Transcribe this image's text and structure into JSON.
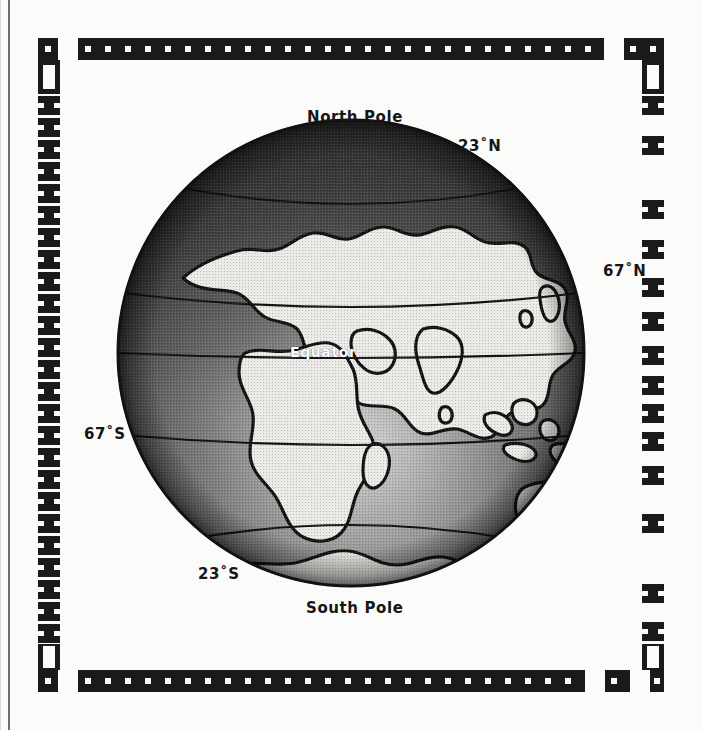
{
  "figure": {
    "type": "globe-illustration",
    "projection": "orthographic",
    "centered_on": "Africa / Indian Ocean",
    "background_color": "#fbfbf9",
    "ink_color": "#161616",
    "ocean_color": "#575757",
    "land_color": "#ededeb",
    "highlight_color": "#e8e8e6"
  },
  "labels": {
    "north_pole": "North Pole",
    "south_pole": "South Pole",
    "tropic_north": "23˚N",
    "circle_north": "67˚N",
    "circle_south": "67˚S",
    "tropic_south": "23˚S",
    "equator": "Equator"
  },
  "latitude_lines": [
    {
      "name": "tropic-of-cancer",
      "label": "23˚N",
      "latitude": 23,
      "side": "right"
    },
    {
      "name": "arctic-circle",
      "label": "67˚N",
      "latitude": 67,
      "side": "right"
    },
    {
      "name": "equator",
      "label": "Equator",
      "latitude": 0,
      "side": "center"
    },
    {
      "name": "antarctic-circle",
      "label": "67˚S",
      "latitude": -67,
      "side": "left"
    },
    {
      "name": "tropic-of-capricorn",
      "label": "23˚S",
      "latitude": -23,
      "side": "left"
    }
  ],
  "border": {
    "style": "decorative-stamp-frame",
    "top_motif": "square-with-dot",
    "side_motif": "dumbbell-bar",
    "color": "#1a1a1a"
  }
}
